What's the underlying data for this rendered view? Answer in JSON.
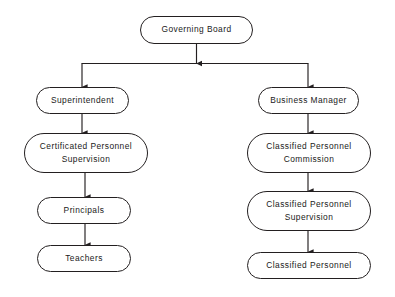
{
  "diagram": {
    "type": "organizational-chart",
    "background_color": "#ffffff",
    "line_color": "#231f20",
    "text_color": "#1a1a1a",
    "node_shape": "rounded-rectangle",
    "nodes": [
      {
        "id": "governing-board",
        "label": "Governing Board",
        "x": 140,
        "y": 16,
        "w": 113,
        "h": 28,
        "level": 0,
        "column": "center"
      },
      {
        "id": "superintendent",
        "label": "Superintendent",
        "x": 36,
        "y": 87,
        "w": 93,
        "h": 27,
        "level": 1,
        "column": "left"
      },
      {
        "id": "business-manager",
        "label": "Business Manager",
        "x": 258,
        "y": 87,
        "w": 101,
        "h": 27,
        "level": 1,
        "column": "right"
      },
      {
        "id": "certificated-personnel-supervision",
        "label": "Certificated Personnel\nSupervision",
        "x": 24,
        "y": 133,
        "w": 124,
        "h": 40,
        "level": 2,
        "column": "left"
      },
      {
        "id": "classified-personnel-commission",
        "label": "Classified Personnel\nCommission",
        "x": 247,
        "y": 133,
        "w": 124,
        "h": 40,
        "level": 2,
        "column": "right"
      },
      {
        "id": "principals",
        "label": "Principals",
        "x": 37,
        "y": 197,
        "w": 94,
        "h": 27,
        "level": 3,
        "column": "left"
      },
      {
        "id": "classified-personnel-supervision",
        "label": "Classified Personnel\nSupervision",
        "x": 247,
        "y": 191,
        "w": 124,
        "h": 40,
        "level": 3,
        "column": "right"
      },
      {
        "id": "teachers",
        "label": "Teachers",
        "x": 37,
        "y": 245,
        "w": 94,
        "h": 27,
        "level": 4,
        "column": "left"
      },
      {
        "id": "classified-personnel",
        "label": "Classified Personnel",
        "x": 247,
        "y": 252,
        "w": 124,
        "h": 27,
        "level": 4,
        "column": "right"
      }
    ],
    "edges": [
      {
        "id": "edge-board-to-bus",
        "from": "governing-board",
        "to": "bus",
        "style": "straight-arrow"
      },
      {
        "id": "edge-bus-to-superintendent",
        "from": "governing-board",
        "to": "superintendent",
        "style": "elbow-arrow"
      },
      {
        "id": "edge-bus-to-business-manager",
        "from": "governing-board",
        "to": "business-manager",
        "style": "elbow-arrow"
      },
      {
        "id": "edge-superintendent-to-certificated",
        "from": "superintendent",
        "to": "certificated-personnel-supervision",
        "style": "straight-arrow"
      },
      {
        "id": "edge-certificated-to-principals",
        "from": "certificated-personnel-supervision",
        "to": "principals",
        "style": "straight-arrow"
      },
      {
        "id": "edge-principals-to-teachers",
        "from": "principals",
        "to": "teachers",
        "style": "straight-arrow"
      },
      {
        "id": "edge-business-manager-to-commission",
        "from": "business-manager",
        "to": "classified-personnel-commission",
        "style": "straight-arrow"
      },
      {
        "id": "edge-commission-to-supervision",
        "from": "classified-personnel-commission",
        "to": "classified-personnel-supervision",
        "style": "straight-arrow"
      },
      {
        "id": "edge-supervision-to-classified",
        "from": "classified-personnel-supervision",
        "to": "classified-personnel",
        "style": "straight-arrow"
      }
    ]
  }
}
